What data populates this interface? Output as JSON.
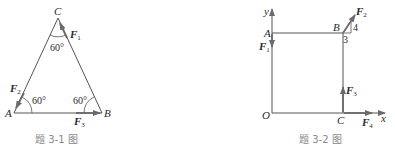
{
  "figures": [
    {
      "caption": "题 3-1 图",
      "points": {
        "A": "A",
        "B": "B",
        "C": "C"
      },
      "angles": {
        "C": "60°",
        "A": "60°",
        "B": "60°"
      },
      "forces": {
        "F1": {
          "main": "F",
          "sub": "1"
        },
        "F2": {
          "main": "F",
          "sub": "2"
        },
        "F3": {
          "main": "F",
          "sub": "3"
        }
      }
    },
    {
      "caption": "题 3-2 图",
      "axes": {
        "x": "x",
        "y": "y"
      },
      "points": {
        "O": "O",
        "A": "A",
        "B": "B",
        "C": "C"
      },
      "slope": {
        "rise": "4",
        "run": "3"
      },
      "forces": {
        "F1": {
          "main": "F",
          "sub": "1"
        },
        "F2": {
          "main": "F",
          "sub": "2"
        },
        "F3": {
          "main": "F",
          "sub": "3"
        },
        "F4": {
          "main": "F",
          "sub": "4"
        }
      }
    }
  ],
  "colors": {
    "line": "#555555",
    "arrow": "#6a6a6a",
    "text": "#2a2a2a",
    "caption": "#8a8a8a"
  }
}
